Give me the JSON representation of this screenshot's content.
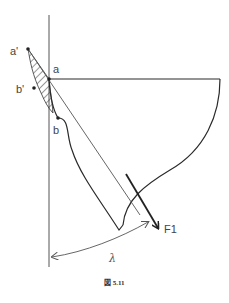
{
  "figure": {
    "caption": "図 5.11",
    "labels": {
      "a_prime": "a'",
      "a": "a",
      "b_prime": "b'",
      "b": "b",
      "force": "F1",
      "angle": "λ"
    }
  },
  "colors": {
    "line": "#2a2a2a",
    "thin_line": "#555555",
    "text": "#444444",
    "background": "#ffffff"
  }
}
